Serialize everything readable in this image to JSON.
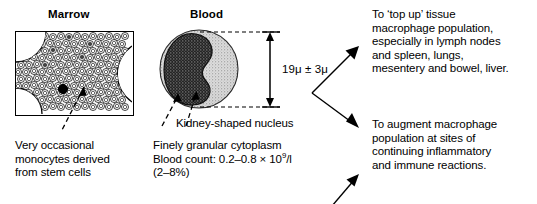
{
  "figure": {
    "background_color": "#ffffff",
    "ink_color": "#000000"
  },
  "panels": {
    "marrow": {
      "title": "Marrow",
      "diagram_name": "bone-marrow-histology-box",
      "caption": "Very occasional\nmonocytes derived\nfrom stem cells",
      "leader_name": "monocyte-in-marrow-leader"
    },
    "blood": {
      "title": "Blood",
      "diagram_name": "monocyte-cell-drawing",
      "size_label": "19μ ± 3μ",
      "nucleus_label": "Kidney-shaped nucleus",
      "caption_line_1": "Finely granular cytoplasm",
      "caption_line_2_prefix": "Blood count: 0.2–0.8 × 10",
      "caption_line_2_exponent": "9",
      "caption_line_2_suffix": "/l",
      "caption_line_3": "(2–8%)"
    }
  },
  "outcomes": [
    {
      "id": "top-up-tissue-macrophages",
      "text": "To ‘top up’ tissue\nmacrophage population,\nespecially in lymph nodes\nand spleen, lungs,\nmesentery and bowel, liver."
    },
    {
      "id": "augment-at-inflammation-sites",
      "text": "To augment macrophage\npopulation at sites of\ncontinuing inflammatory\nand immune reactions."
    }
  ],
  "arrows": [
    {
      "id": "fork-arrow-upper",
      "from": [
        312,
        93
      ],
      "to": [
        359,
        47
      ]
    },
    {
      "id": "fork-arrow-lower",
      "from": [
        312,
        93
      ],
      "to": [
        359,
        129
      ]
    },
    {
      "id": "feedback-arrow-bottom",
      "from": [
        330,
        204
      ],
      "to": [
        359,
        174
      ]
    }
  ],
  "dimension_line": {
    "id": "cell-diameter-dimension",
    "top_y": 32,
    "bottom_y": 107,
    "x": 270
  },
  "colors": {
    "ink": "#000000",
    "paper": "#ffffff",
    "cytoplasm_stipple": "#a8a8a8",
    "nucleus": "#1a1a1a"
  }
}
